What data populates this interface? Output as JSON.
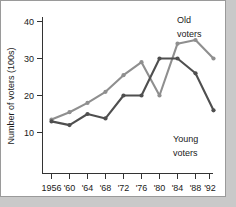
{
  "chart_data": {
    "type": "line",
    "title": "",
    "xlabel": "",
    "ylabel": "Number of voters (100s)",
    "categories": [
      "1956",
      "'60",
      "'64",
      "'68",
      "'72",
      "'76",
      "'80",
      "'84",
      "'88",
      "'92"
    ],
    "x_tick_labels": [
      "1956",
      "'60",
      "'64",
      "'68",
      "'72",
      "'76",
      "'80",
      "'84",
      "'88",
      "'92"
    ],
    "y_tick_labels": [
      "10",
      "20",
      "30",
      "40"
    ],
    "y_ticks": [
      10,
      20,
      30,
      40
    ],
    "ylim": [
      0,
      42
    ],
    "grid": false,
    "legend_position": "inline-annotations",
    "series": [
      {
        "name": "Old voters",
        "color": "#8f8f8f",
        "values": [
          13.5,
          15.5,
          18,
          21,
          25.5,
          29,
          20,
          34,
          35,
          30
        ]
      },
      {
        "name": "Young voters",
        "color": "#4f4f4f",
        "values": [
          13,
          12,
          15,
          13.8,
          20,
          20,
          30,
          30,
          26,
          16
        ]
      }
    ],
    "annotations": [
      {
        "text_line1": "Old",
        "text_line2": "voters",
        "series": "Old voters"
      },
      {
        "text_line1": "Young",
        "text_line2": "voters",
        "series": "Young voters"
      }
    ]
  },
  "labels": {
    "y_axis_title": "Number of voters (100s)",
    "old_voters_line1": "Old",
    "old_voters_line2": "voters",
    "young_voters_line1": "Young",
    "young_voters_line2": "voters"
  },
  "colors": {
    "old_voters": "#8f8f8f",
    "young_voters": "#4f4f4f",
    "axis": "#333333",
    "background": "#ffffff",
    "page_background": "#c9c9c9"
  }
}
